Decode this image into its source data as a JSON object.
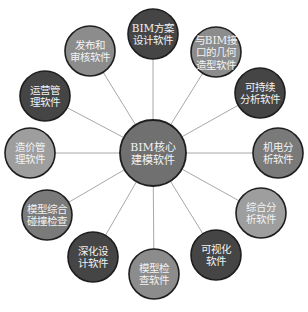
{
  "diagram": {
    "type": "hub-and-spoke",
    "hub": {
      "lines": [
        "BIM核心",
        "建模软件"
      ],
      "x": 153,
      "y": 153,
      "r": 33,
      "color": "#707070"
    },
    "nodes": [
      {
        "id": "bim-scheme-design",
        "lines": [
          "BIM方案",
          "设计软件"
        ],
        "x": 153,
        "y": 34,
        "r": 25,
        "color": "#454545"
      },
      {
        "id": "geometry-modeling",
        "lines": [
          "与BIM接",
          "口的几何",
          "造型软件"
        ],
        "x": 216,
        "y": 52,
        "r": 25,
        "color": "#8c8c8c"
      },
      {
        "id": "sustainability-analysis",
        "lines": [
          "可持续",
          "分析软件"
        ],
        "x": 260,
        "y": 93,
        "r": 25,
        "color": "#454545"
      },
      {
        "id": "mep-analysis",
        "lines": [
          "机电分",
          "析软件"
        ],
        "x": 278,
        "y": 153,
        "r": 25,
        "color": "#7a7a7a"
      },
      {
        "id": "comprehensive-analysis",
        "lines": [
          "综合分",
          "析软件"
        ],
        "x": 261,
        "y": 213,
        "r": 25,
        "color": "#9e9e9e"
      },
      {
        "id": "visualization",
        "lines": [
          "可视化",
          "软件"
        ],
        "x": 216,
        "y": 255,
        "r": 25,
        "color": "#454545"
      },
      {
        "id": "model-checking",
        "lines": [
          "模型检",
          "查软件"
        ],
        "x": 154,
        "y": 274,
        "r": 25,
        "color": "#8c8c8c"
      },
      {
        "id": "detailed-design",
        "lines": [
          "深化设",
          "计软件"
        ],
        "x": 93,
        "y": 257,
        "r": 25,
        "color": "#454545"
      },
      {
        "id": "clash-detection",
        "lines": [
          "模型综合",
          "碰撞检查"
        ],
        "x": 47,
        "y": 215,
        "r": 25,
        "color": "#7a7a7a"
      },
      {
        "id": "cost-management",
        "lines": [
          "造价管",
          "理软件"
        ],
        "x": 30,
        "y": 153,
        "r": 25,
        "color": "#9e9e9e"
      },
      {
        "id": "operations-management",
        "lines": [
          "运营管",
          "理软件"
        ],
        "x": 45,
        "y": 96,
        "r": 25,
        "color": "#454545"
      },
      {
        "id": "publish-review",
        "lines": [
          "发布和",
          "审核软件"
        ],
        "x": 90,
        "y": 51,
        "r": 25,
        "color": "#8c8c8c"
      }
    ],
    "edge_color": "#a8a8a8",
    "border_color": "#1e1e1e"
  }
}
